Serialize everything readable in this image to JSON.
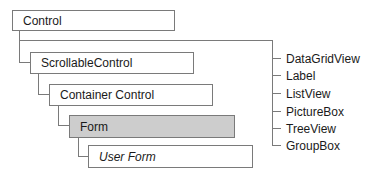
{
  "diagram": {
    "hierarchy": [
      {
        "label": "Control",
        "style": "normal"
      },
      {
        "label": "ScrollableControl",
        "style": "normal"
      },
      {
        "label": "Container Control",
        "style": "normal"
      },
      {
        "label": "Form",
        "style": "shaded"
      },
      {
        "label": "User Form",
        "style": "italic"
      }
    ],
    "sibling_controls": [
      {
        "label": "DataGridView"
      },
      {
        "label": "Label"
      },
      {
        "label": "ListView"
      },
      {
        "label": "PictureBox"
      },
      {
        "label": "TreeView"
      },
      {
        "label": "GroupBox"
      }
    ],
    "colors": {
      "line": "#7a7a7a",
      "shaded_fill": "#cdcdcd"
    }
  }
}
